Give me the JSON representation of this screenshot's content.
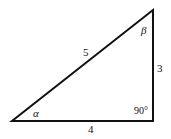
{
  "diagram": {
    "type": "right-triangle",
    "stroke_color": "#111111",
    "background": "#ffffff",
    "vertices": {
      "left": [
        12,
        121
      ],
      "bottom_right": [
        153,
        121
      ],
      "top_right": [
        153,
        10
      ]
    },
    "labels": {
      "hypotenuse": "5",
      "vertical_side": "3",
      "base": "4",
      "angle_left": "α",
      "angle_top": "β",
      "right_angle": "90°"
    }
  }
}
